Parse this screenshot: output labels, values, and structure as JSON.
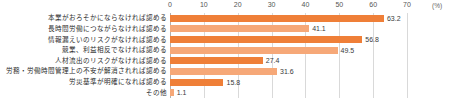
{
  "chart_data": {
    "type": "bar",
    "orientation": "horizontal",
    "title": "",
    "xlabel": "",
    "ylabel": "",
    "unit_label": "(%)",
    "xlim": [
      0,
      70
    ],
    "xticks": [
      0,
      10,
      20,
      30,
      40,
      50,
      60,
      70
    ],
    "xtick_labels": [
      "0",
      "10",
      "20",
      "30",
      "40",
      "50",
      "60",
      "70"
    ],
    "grid": true,
    "legend": "none",
    "categories": [
      "本業がおろそかにならなければ認める",
      "長時間労働につながらなければ認める",
      "情報漏えいのリスクがなければ認める",
      "競業、利益相反でなければ認める",
      "人材流出のリスクがなければ認める",
      "労務・労働時間管理上の不安が解消されれば認める",
      "労災基準が明確になれば認める",
      "その他"
    ],
    "values": [
      63.2,
      41.1,
      56.8,
      49.5,
      27.4,
      31.6,
      15.8,
      1.1
    ],
    "value_labels": [
      "63.2",
      "41.1",
      "56.8",
      "49.5",
      "27.4",
      "31.6",
      "15.8",
      "1.1"
    ],
    "bar_colors": [
      "#ef7f38",
      "#f6a878",
      "#ef7f38",
      "#f6a878",
      "#ef7f38",
      "#f6a878",
      "#ef7f38",
      "#f6a878"
    ],
    "colors": {
      "bar_dark": "#ef7f38",
      "bar_light": "#f6a878",
      "grid": "#d9d9d9",
      "axis": "#b0b0b0",
      "text": "#333333",
      "background": "#ffffff"
    }
  }
}
